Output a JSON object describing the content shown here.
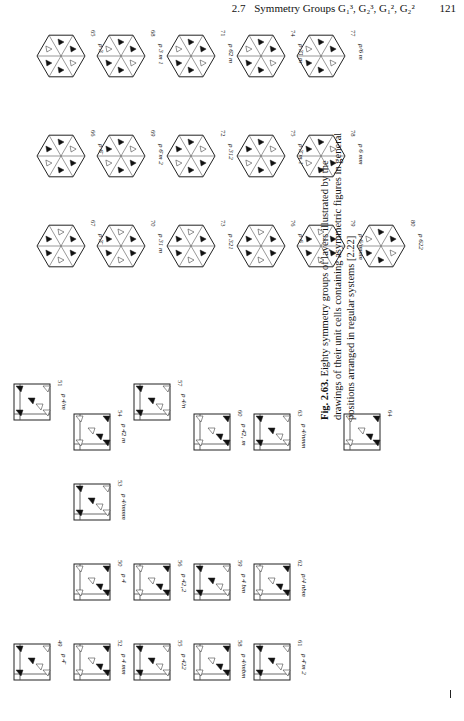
{
  "header": {
    "section": "2.7",
    "title": "Symmetry Groups G₁³, G₂³, G₁², G₂²",
    "page_number": "121"
  },
  "hexagons": [
    {
      "num": "65",
      "label": "p 3"
    },
    {
      "num": "66",
      "label": "p 6̄"
    },
    {
      "num": "67",
      "label": "p 3̄"
    },
    {
      "num": "68",
      "label": "p 3 m 1"
    },
    {
      "num": "69",
      "label": "p 6̄ m 2"
    },
    {
      "num": "70",
      "label": "p 31 m"
    },
    {
      "num": "71",
      "label": "p 6̄2 m"
    },
    {
      "num": "72",
      "label": "p 312"
    },
    {
      "num": "73",
      "label": "p 321"
    },
    {
      "num": "74",
      "label": "p 3̄1 m"
    },
    {
      "num": "75",
      "label": "p 3̄ m 1"
    },
    {
      "num": "76",
      "label": "p 6"
    },
    {
      "num": "77",
      "label": "p/6 m"
    },
    {
      "num": "78",
      "label": "p 6 mm"
    },
    {
      "num": "79",
      "label": "p 6/mmm"
    },
    {
      "num": "80",
      "label": "p 622"
    }
  ],
  "squares": [
    {
      "num": "49",
      "label": "p 4̄"
    },
    {
      "num": "50",
      "label": "p 4"
    },
    {
      "num": "51",
      "label": "p 4/m"
    },
    {
      "num": "52",
      "label": "p 4 mm"
    },
    {
      "num": "53",
      "label": "p 4/mmm"
    },
    {
      "num": "54",
      "label": "p 4̄2 m"
    },
    {
      "num": "55",
      "label": "p 422"
    },
    {
      "num": "56",
      "label": "p 42₁2"
    },
    {
      "num": "57",
      "label": "p 4/n"
    },
    {
      "num": "58",
      "label": "p 4/mbm"
    },
    {
      "num": "59",
      "label": "p 4 bm"
    },
    {
      "num": "60",
      "label": "p 4̄2₁ m"
    },
    {
      "num": "61",
      "label": "p 4̄ m 2"
    },
    {
      "num": "62",
      "label": "p/4 nbm"
    },
    {
      "num": "63",
      "label": "p 4/nmm"
    },
    {
      "num": "64",
      "label": ""
    }
  ],
  "caption": {
    "fig": "Fig. 2.63.",
    "text": "Eighty symmetry groups of layers illustrated by the drawings of their unit cells containing asymmetric figures in general positions arranged in regular systems [2.22]"
  }
}
